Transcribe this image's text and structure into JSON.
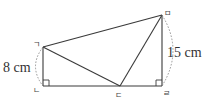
{
  "figure": {
    "vertices": {
      "a": {
        "label": "ㄱ",
        "x": 43,
        "y": 47
      },
      "b": {
        "label": "ㄴ",
        "x": 43,
        "y": 86
      },
      "c": {
        "label": "ㄷ",
        "x": 120,
        "y": 86
      },
      "d": {
        "label": "ㄹ",
        "x": 162,
        "y": 86
      },
      "e": {
        "label": "ㅁ",
        "x": 162,
        "y": 15
      }
    },
    "measurements": {
      "left_side": "8 cm",
      "right_side": "15 cm"
    },
    "colors": {
      "line": "#3a3a3a",
      "arc": "#8a8a8a",
      "text": "#333333"
    }
  }
}
